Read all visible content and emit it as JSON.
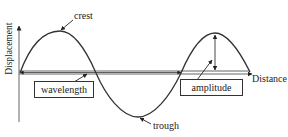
{
  "diagram": {
    "type": "transverse-wave",
    "axes": {
      "y_label": "Displacement",
      "x_label": "Distance"
    },
    "labels": {
      "crest": "crest",
      "trough": "trough",
      "wavelength": "wavelength",
      "amplitude": "amplitude"
    },
    "colors": {
      "line": "#333333",
      "axis": "#555555",
      "background": "#ffffff"
    }
  }
}
